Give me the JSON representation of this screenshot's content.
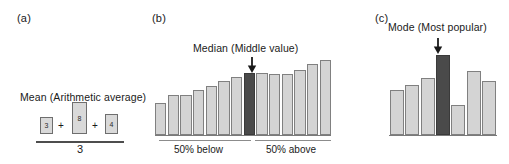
{
  "figure": {
    "background": "#ffffff",
    "bar_fill": "#d4d4d4",
    "bar_stroke": "#808080",
    "highlight_fill": "#4a4a4a",
    "axis_color": "#7a7a7a"
  },
  "panels": {
    "a": {
      "letter": "(a)",
      "caption": "Mean (Arithmetic average)",
      "boxes": [
        {
          "value": "3"
        },
        {
          "value": "8"
        },
        {
          "value": "4"
        }
      ],
      "operator": "+",
      "denominator": "3"
    },
    "b": {
      "letter": "(b)",
      "caption": "Median (Middle value)",
      "arrow": "down-arrow-icon",
      "left_label": "50% below",
      "right_label": "50% above"
    },
    "c": {
      "letter": "(c)",
      "caption": "Mode (Most popular)",
      "arrow": "down-arrow-icon"
    }
  },
  "chart_data": [
    {
      "id": "median-chart",
      "type": "bar",
      "title": "Median (Middle value)",
      "xlabel": "",
      "ylabel": "",
      "grid": false,
      "legend": null,
      "ylim": [
        0,
        100
      ],
      "categories": [
        "1",
        "2",
        "3",
        "4",
        "5",
        "6",
        "7",
        "8",
        "9",
        "10",
        "11",
        "12",
        "13",
        "14"
      ],
      "values": [
        40,
        50,
        50,
        57,
        62,
        68,
        73,
        78,
        78,
        76,
        76,
        81,
        89,
        94
      ],
      "highlight_index": 7,
      "annotations": [
        "50% below",
        "50% above"
      ]
    },
    {
      "id": "mode-chart",
      "type": "bar",
      "title": "Mode (Most popular)",
      "xlabel": "",
      "ylabel": "",
      "grid": false,
      "legend": null,
      "ylim": [
        0,
        100
      ],
      "categories": [
        "1",
        "2",
        "3",
        "4",
        "5",
        "6",
        "7"
      ],
      "values": [
        56,
        63,
        71,
        100,
        38,
        80,
        68
      ],
      "highlight_index": 3,
      "annotations": []
    },
    {
      "id": "mean-illustration",
      "type": "bar",
      "title": "Mean (Arithmetic average)",
      "xlabel": "",
      "ylabel": "",
      "grid": false,
      "legend": null,
      "categories": [
        "3",
        "8",
        "4"
      ],
      "values": [
        3,
        8,
        4
      ],
      "annotations": [
        "3"
      ]
    }
  ]
}
